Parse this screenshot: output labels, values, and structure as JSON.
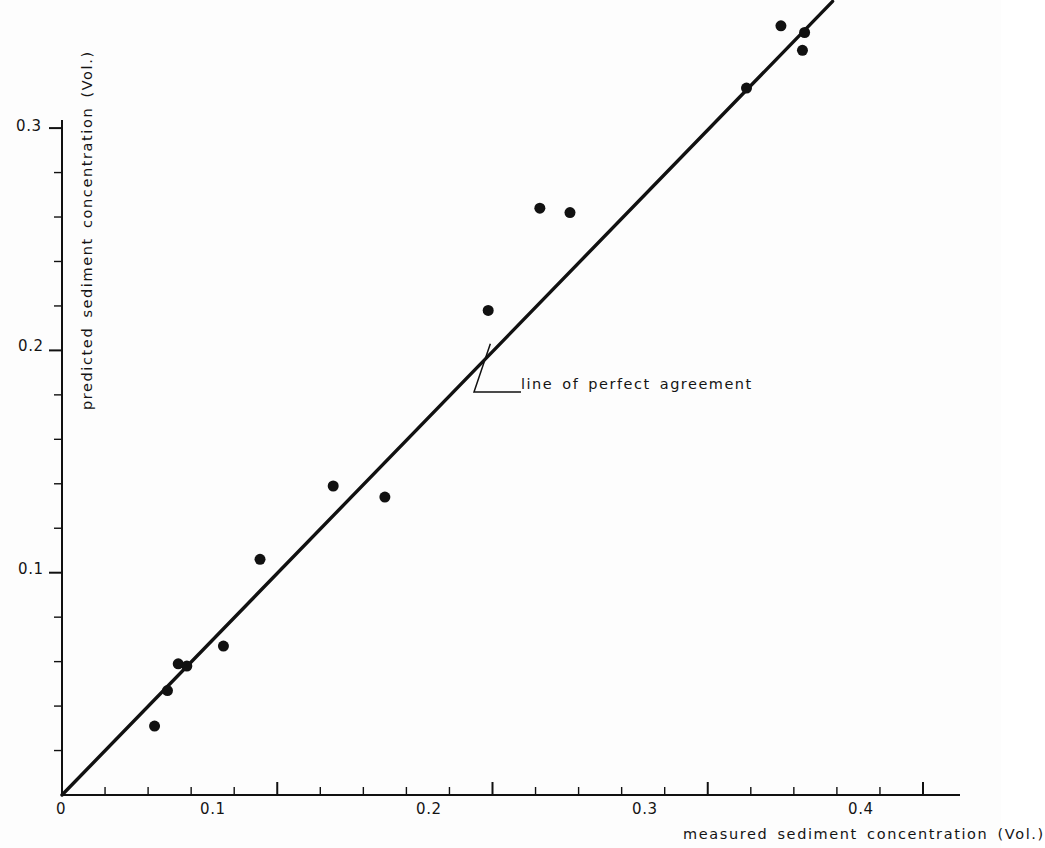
{
  "chart_data": {
    "type": "scatter",
    "title": "",
    "xlabel": "measured sediment concentration (Vol.)",
    "ylabel": "predicted sediment concentration (Vol.)",
    "xlim": [
      0,
      0.4
    ],
    "ylim": [
      0,
      0.31
    ],
    "grid": false,
    "legend": "none",
    "x_major_ticks": [
      0,
      0.1,
      0.2,
      0.3,
      0.4
    ],
    "x_major_tick_labels": [
      "0",
      "0.1",
      "0.2",
      "0.3",
      "0.4"
    ],
    "x_minor_tick_step": 0.02,
    "y_major_ticks": [
      0.1,
      0.2,
      0.3
    ],
    "y_major_tick_labels": [
      "0.1",
      "0.2",
      "0.3"
    ],
    "y_minor_tick_step": 0.02,
    "marker": "filled-circle",
    "marker_color": "#111111",
    "marker_size_px": 11,
    "points": [
      {
        "x": 0.043,
        "y": 0.031
      },
      {
        "x": 0.049,
        "y": 0.047
      },
      {
        "x": 0.054,
        "y": 0.059
      },
      {
        "x": 0.058,
        "y": 0.058
      },
      {
        "x": 0.075,
        "y": 0.067
      },
      {
        "x": 0.092,
        "y": 0.106
      },
      {
        "x": 0.126,
        "y": 0.139
      },
      {
        "x": 0.15,
        "y": 0.134
      },
      {
        "x": 0.198,
        "y": 0.218
      },
      {
        "x": 0.222,
        "y": 0.264
      },
      {
        "x": 0.236,
        "y": 0.262
      },
      {
        "x": 0.318,
        "y": 0.318
      },
      {
        "x": 0.334,
        "y": 0.346
      },
      {
        "x": 0.344,
        "y": 0.335
      },
      {
        "x": 0.345,
        "y": 0.343
      }
    ],
    "reference_line": {
      "label": "line of perfect agreement",
      "from": [
        0,
        0
      ],
      "to": [
        0.358,
        0.357
      ],
      "color": "#111111"
    },
    "annotations": [
      {
        "text": "line of perfect agreement",
        "anchor_x": 0.199,
        "anchor_y": 0.203
      }
    ]
  },
  "axes": {
    "x_title": "measured sediment concentration (Vol.)",
    "y_title": "predicted sediment concentration (Vol.)",
    "x_ticks": [
      "0",
      "0.1",
      "0.2",
      "0.3",
      "0.4"
    ],
    "y_ticks": [
      "0.1",
      "0.2",
      "0.3"
    ]
  },
  "annotation": {
    "line_of_perfect_agreement": "line of perfect agreement"
  },
  "colors": {
    "ink": "#111111",
    "background": "#fdfdfd"
  }
}
